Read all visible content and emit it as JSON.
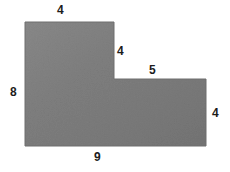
{
  "figure": {
    "kind": "composite-l-shape-polygon",
    "background_color": "#ffffff",
    "fill_color": "#7d7d7d",
    "fill_color_light": "#888888",
    "fill_color_dark": "#747474",
    "edge_color": "#6e6e6e",
    "label_color": "#1c1c1c",
    "labels": {
      "top": "4",
      "notch_right": "4",
      "upper_right": "5",
      "left": "8",
      "right": "4",
      "bottom": "9"
    },
    "label_names": {
      "top": "top-edge-length",
      "notch_right": "notch-vertical-edge-length",
      "upper_right": "notch-horizontal-edge-length",
      "left": "left-edge-length",
      "right": "right-edge-length",
      "bottom": "bottom-edge-length"
    }
  },
  "chart_data": {
    "type": "diagram",
    "title": "",
    "shape": "L-shaped polygon (concave hexagon)",
    "vertices_px": [
      [
        25,
        22
      ],
      [
        114,
        22
      ],
      [
        114,
        79
      ],
      [
        206,
        79
      ],
      [
        206,
        146
      ],
      [
        25,
        146
      ]
    ],
    "edges": [
      {
        "name": "top",
        "from": [
          25,
          22
        ],
        "to": [
          114,
          22
        ],
        "label": "4",
        "orientation": "horizontal"
      },
      {
        "name": "notch_right",
        "from": [
          114,
          22
        ],
        "to": [
          114,
          79
        ],
        "label": "4",
        "orientation": "vertical"
      },
      {
        "name": "upper_right",
        "from": [
          114,
          79
        ],
        "to": [
          206,
          79
        ],
        "label": "5",
        "orientation": "horizontal"
      },
      {
        "name": "right",
        "from": [
          206,
          79
        ],
        "to": [
          206,
          146
        ],
        "label": "4",
        "orientation": "vertical"
      },
      {
        "name": "bottom",
        "from": [
          206,
          146
        ],
        "to": [
          25,
          146
        ],
        "label": "9",
        "orientation": "horizontal"
      },
      {
        "name": "left",
        "from": [
          25,
          146
        ],
        "to": [
          25,
          22
        ],
        "label": "8",
        "orientation": "vertical"
      }
    ],
    "side_lengths": [
      4,
      4,
      5,
      4,
      9,
      8
    ],
    "grid": false,
    "legend": false
  }
}
